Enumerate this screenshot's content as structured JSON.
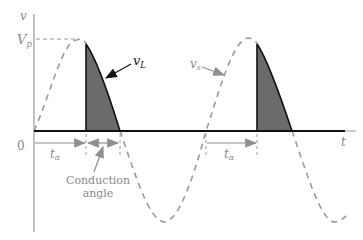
{
  "figure": {
    "axis_labels": {
      "y": "v",
      "x": "t",
      "origin": "0",
      "peak": {
        "base": "V",
        "sub": "p"
      }
    },
    "curves": {
      "source": {
        "base": "v",
        "sub": "s",
        "style": "dashed",
        "color": "#9a9a9a"
      },
      "load": {
        "base": "v",
        "sub": "L",
        "style": "filled",
        "color": "#6b6b6b"
      }
    },
    "annotations": {
      "firing_delay_1": {
        "base": "t",
        "sub": "α"
      },
      "firing_delay_2": {
        "base": "t",
        "sub": "α"
      },
      "conduction_line1": "Conduction",
      "conduction_line2": "angle"
    }
  }
}
